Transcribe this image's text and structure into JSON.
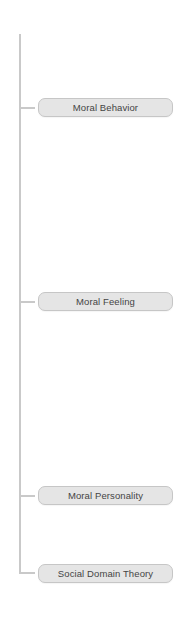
{
  "diagram": {
    "type": "tree-branch",
    "line_color": "#c9c9c9",
    "node_fill": "#e5e5e5",
    "node_border": "#c6c6c6",
    "text_color": "#444444",
    "nodes": [
      {
        "label": "Moral Behavior"
      },
      {
        "label": "Moral Feeling"
      },
      {
        "label": "Moral Personality"
      },
      {
        "label": "Social Domain Theory"
      }
    ]
  }
}
